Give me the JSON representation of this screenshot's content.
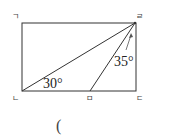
{
  "diagram": {
    "vertices": {
      "top_left": "ㄱ",
      "top_right": "ㄹ",
      "bottom_left": "ㄴ",
      "bottom_middle": "ㅁ",
      "bottom_right": "ㄷ"
    },
    "angles": {
      "at_bottom_left": "30°",
      "at_top_right": "35°"
    },
    "answer_blank": "("
  }
}
